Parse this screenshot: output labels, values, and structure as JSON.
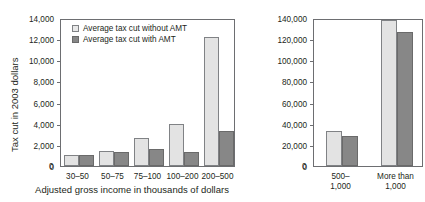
{
  "figure": {
    "clipped_title": "",
    "legend": {
      "items": [
        {
          "key": "light",
          "label": "Average tax cut without AMT",
          "color": "#e3e3e3"
        },
        {
          "key": "dark",
          "label": "Average tax cut with AMT",
          "color": "#878787"
        }
      ]
    },
    "y_axis_title": "Tax cut in 2003 dollars",
    "x_axis_title": "Adjusted gross income in thousands of dollars"
  },
  "chart_data": [
    {
      "id": "left-panel",
      "type": "bar",
      "title": "",
      "xlabel": "Adjusted gross income in thousands of dollars",
      "ylabel": "Tax cut in 2003 dollars",
      "categories": [
        "30–50",
        "50–75",
        "75–100",
        "100–200",
        "200–500"
      ],
      "series": [
        {
          "name": "Average tax cut without AMT",
          "values": [
            1000,
            1450,
            2650,
            4000,
            12200
          ]
        },
        {
          "name": "Average tax cut with AMT",
          "values": [
            1000,
            1300,
            1650,
            1300,
            3300
          ]
        }
      ],
      "ylim": [
        0,
        14000
      ],
      "yticks": [
        0,
        2000,
        4000,
        6000,
        8000,
        10000,
        12000,
        14000
      ],
      "ytick_labels": [
        "0",
        "2,000",
        "4,000",
        "6,000",
        "8,000",
        "10,000",
        "12,000",
        "14,000"
      ],
      "grid": false,
      "legend_position": "top-left"
    },
    {
      "id": "right-panel",
      "type": "bar",
      "title": "",
      "xlabel": "",
      "ylabel": "",
      "categories": [
        "500–\n1,000",
        "More than\n1,000"
      ],
      "series": [
        {
          "name": "Average tax cut without AMT",
          "values": [
            33000,
            138000
          ]
        },
        {
          "name": "Average tax cut with AMT",
          "values": [
            28500,
            126500
          ]
        }
      ],
      "ylim": [
        0,
        140000
      ],
      "yticks": [
        0,
        20000,
        40000,
        60000,
        80000,
        100000,
        120000,
        140000
      ],
      "ytick_labels": [
        "0",
        "20,000",
        "40,000",
        "60,000",
        "80,000",
        "100,000",
        "120,000",
        "140,000"
      ],
      "grid": false,
      "legend_position": "none"
    }
  ]
}
